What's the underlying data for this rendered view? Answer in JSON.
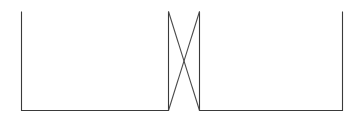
{
  "canvas": {
    "width": 361,
    "height": 121,
    "background_color": "#ffffff",
    "description": "Line diagram of two open rectangles joined by a crossed pair of diagonal connectors forming an X"
  },
  "style": {
    "stroke_color": "#3a3a3a",
    "connector_color": "#4a4a4a",
    "stroke_width": 1.1,
    "fill_color": "none"
  },
  "chart_data": {
    "type": "diagram",
    "title": "",
    "shapes": [
      {
        "name": "left-rectangle",
        "kind": "rectangle",
        "x": 21,
        "y": 11,
        "width": 147,
        "height": 99,
        "fill": "none",
        "stroke": "#3a3a3a",
        "top_edge_gradient": [
          "#7b4fd0",
          "#8f6fb8",
          "#9a7f6a",
          "#6b6a40"
        ]
      },
      {
        "name": "right-rectangle",
        "kind": "rectangle",
        "x": 199,
        "y": 11,
        "width": 143,
        "height": 99,
        "fill": "none",
        "stroke": "#3a3a3a",
        "top_edge_gradient": [
          "#4a4a4a",
          "#5d7a52",
          "#7fa06e",
          "#587050"
        ]
      }
    ],
    "connectors": [
      {
        "name": "connector-top-left-to-bottom-right",
        "kind": "line",
        "x1": 168,
        "y1": 11,
        "x2": 199,
        "y2": 110,
        "stroke": "#4a4a4a"
      },
      {
        "name": "connector-bottom-left-to-top-right",
        "kind": "line",
        "x1": 168,
        "y1": 110,
        "x2": 199,
        "y2": 11,
        "stroke": "#4a4a4a"
      }
    ],
    "crossing_point": {
      "x": 183,
      "y": 61
    }
  }
}
